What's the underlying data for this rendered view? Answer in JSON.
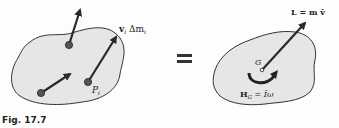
{
  "figure": {
    "caption": "Fig. 17.7",
    "equals_sign": "=",
    "colors": {
      "body_fill": "#e6e6e6",
      "outline": "#333333",
      "vector": "#2a2a2a",
      "particle": "#555555"
    }
  },
  "left_body": {
    "description": "System of particles with momenta",
    "particles": [
      {
        "x": 69,
        "y": 45,
        "arrow_to": [
          80,
          10
        ]
      },
      {
        "x": 41,
        "y": 93,
        "arrow_to": [
          70,
          73
        ]
      },
      {
        "x": 88,
        "y": 82,
        "arrow_to": [
          116,
          37
        ]
      }
    ],
    "momentum_label": {
      "vector": "v",
      "sub": "i",
      "rest": " Δm",
      "sub2": "i"
    },
    "point_label": {
      "text": "P",
      "sub": "i"
    }
  },
  "right_body": {
    "description": "Rigid body equivalent at mass center",
    "center_label": "G",
    "linear_momentum_label": "L = m v̄",
    "angular_momentum_label": {
      "H": "H",
      "sub": "G",
      "rest": " = Īω"
    }
  }
}
